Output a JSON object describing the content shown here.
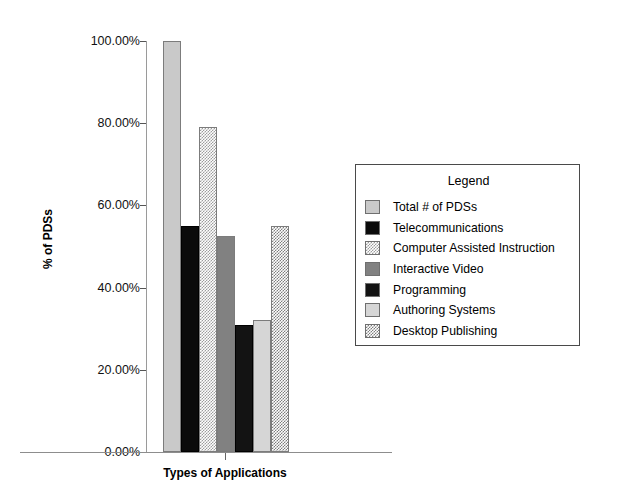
{
  "chart_data": {
    "type": "bar",
    "title": "",
    "xlabel": "Types of Applications",
    "ylabel": "% of PDSs",
    "ylim": [
      0,
      100
    ],
    "grid": false,
    "legend_position": "right",
    "legend_title": "Legend",
    "categories": [
      "Types of Applications"
    ],
    "yticks": [
      "0.00%",
      "20.00%",
      "40.00%",
      "60.00%",
      "80.00%",
      "100.00%"
    ],
    "ytick_values": [
      0,
      20,
      40,
      60,
      80,
      100
    ],
    "series": [
      {
        "name": "Total # of PDSs",
        "values": [
          100.0
        ],
        "fill": "solid-light",
        "color": "#c9c9c9"
      },
      {
        "name": "Telecommunications",
        "values": [
          55.0
        ],
        "fill": "solid-black",
        "color": "#0b0b0b"
      },
      {
        "name": "Computer Assisted Instruction",
        "values": [
          79.0
        ],
        "fill": "check-light",
        "color": "#9d9d9d"
      },
      {
        "name": "Interactive Video",
        "values": [
          52.5
        ],
        "fill": "solid-mid",
        "color": "#818181"
      },
      {
        "name": "Programming",
        "values": [
          31.0
        ],
        "fill": "solid-dark",
        "color": "#131313"
      },
      {
        "name": "Authoring Systems",
        "values": [
          32.0
        ],
        "fill": "solid-pale",
        "color": "#d6d6d6"
      },
      {
        "name": "Desktop Publishing",
        "values": [
          55.0
        ],
        "fill": "check-mid",
        "color": "#7e7e7e"
      }
    ]
  },
  "axes": {
    "y_label": "% of PDSs",
    "x_label": "Types of Applications",
    "y_ticks": [
      {
        "label": "100.00%",
        "value": 100
      },
      {
        "label": "80.00%",
        "value": 80
      },
      {
        "label": "60.00%",
        "value": 60
      },
      {
        "label": "40.00%",
        "value": 40
      },
      {
        "label": "20.00%",
        "value": 20
      },
      {
        "label": "0.00%",
        "value": 0
      }
    ]
  },
  "legend": {
    "title": "Legend",
    "items": [
      {
        "label": "Total # of PDSs",
        "fill": "solid-light"
      },
      {
        "label": "Telecommunications",
        "fill": "solid-black"
      },
      {
        "label": "Computer Assisted Instruction",
        "fill": "check-light"
      },
      {
        "label": "Interactive Video",
        "fill": "solid-mid"
      },
      {
        "label": "Programming",
        "fill": "solid-dark"
      },
      {
        "label": "Authoring Systems",
        "fill": "solid-pale"
      },
      {
        "label": "Desktop Publishing",
        "fill": "check-mid"
      }
    ]
  }
}
